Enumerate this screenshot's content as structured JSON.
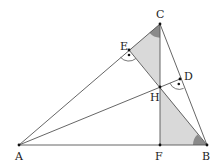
{
  "diagram": {
    "type": "triangle-orthocenter",
    "points": {
      "A": {
        "label": "A",
        "x": 19,
        "y": 145
      },
      "B": {
        "label": "B",
        "x": 207,
        "y": 145
      },
      "C": {
        "label": "C",
        "x": 160,
        "y": 24
      },
      "D": {
        "label": "D",
        "x": 180,
        "y": 79
      },
      "E": {
        "label": "E",
        "x": 129,
        "y": 50
      },
      "F": {
        "label": "F",
        "x": 160,
        "y": 145
      },
      "H": {
        "label": "H",
        "x": 160,
        "y": 87
      }
    },
    "segments": [
      "AB",
      "AC",
      "BC",
      "CF",
      "AD",
      "BE"
    ],
    "shaded_regions": [
      "triangle CEH",
      "triangle HFB"
    ],
    "right_angle_marks": [
      "E",
      "D"
    ],
    "angle_marks": [
      "C (angle ECH)",
      "B (angle HBF)"
    ],
    "colors": {
      "line": "#555555",
      "shade": "#d9d9d9",
      "angle_fill": "#8a8a8a",
      "point": "#111111"
    }
  }
}
